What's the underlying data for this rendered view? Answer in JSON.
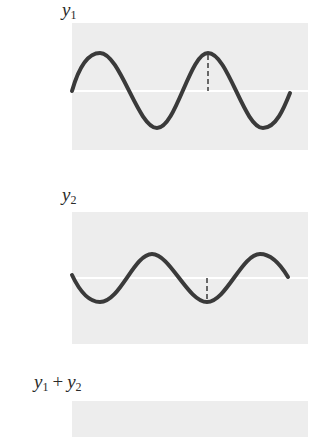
{
  "panels": [
    {
      "label_main": "y",
      "label_sub": "1",
      "description": "Wave y1: sinusoid, amplitude ~38px, starts at zero rising; dashed marker at second crest",
      "marker": "crest"
    },
    {
      "label_main": "y",
      "label_sub": "2",
      "description": "Wave y2: sinusoid, smaller amplitude ~24px, out of phase with y1; dashed marker at trough",
      "marker": "trough"
    },
    {
      "label_a_main": "y",
      "label_a_sub": "1",
      "plus": "+",
      "label_b_main": "y",
      "label_b_sub": "2",
      "description": "Sum panel (cropped)"
    }
  ],
  "colors": {
    "panel_bg": "#ededed",
    "wave": "#3a3a3a",
    "axis": "#ffffff"
  }
}
